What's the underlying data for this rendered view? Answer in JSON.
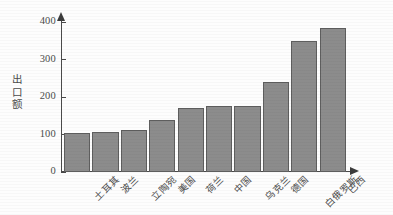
{
  "chart_data": {
    "type": "bar",
    "title": "",
    "xlabel": "",
    "ylabel": "出口额",
    "ylim": [
      0,
      420
    ],
    "yticks": [
      0,
      100,
      200,
      300,
      400
    ],
    "grid": false,
    "legend": false,
    "categories": [
      "土耳其",
      "波兰",
      "立陶宛",
      "美国",
      "荷兰",
      "中国",
      "乌克兰",
      "德国",
      "白俄罗斯",
      "巴西"
    ],
    "values": [
      105,
      108,
      112,
      140,
      170,
      175,
      175,
      240,
      350,
      385
    ],
    "bar_color": "#8c8c8c",
    "bar_border_color": "#5e5e5e",
    "axis_color": "#4a4a4a"
  },
  "axis": {
    "y_title_chars": [
      "出",
      "口",
      "额"
    ],
    "y_tick_labels": [
      "400",
      "300",
      "200",
      "100",
      "0"
    ]
  }
}
